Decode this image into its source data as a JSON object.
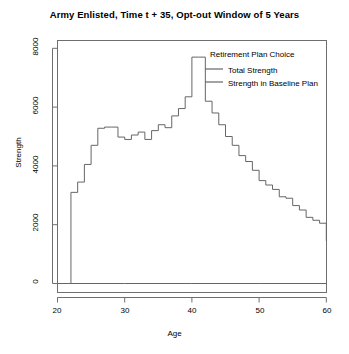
{
  "chart_data": {
    "type": "line",
    "title": "Army Enlisted, Time t + 35, Opt-out Window of 5 Years",
    "xlabel": "Age",
    "ylabel": "Strength",
    "xlim": [
      20,
      60
    ],
    "ylim": [
      0,
      8000
    ],
    "xticks": [
      20,
      30,
      40,
      50,
      60
    ],
    "yticks": [
      0,
      2000,
      4000,
      6000,
      8000
    ],
    "grid": false,
    "legend_position": "top-right-inside",
    "legend_title": "Retirement Plan Choice",
    "line_color": "#666666",
    "series": [
      {
        "name": "Total Strength",
        "style": "step",
        "x": [
          20,
          21,
          22,
          23,
          24,
          25,
          26,
          27,
          28,
          29,
          30,
          31,
          32,
          33,
          34,
          35,
          36,
          37,
          38,
          39,
          40,
          41,
          42,
          43,
          44,
          45,
          46,
          47,
          48,
          49,
          50,
          51,
          52,
          53,
          54,
          55,
          56,
          57,
          58,
          59,
          60
        ],
        "values": [
          0,
          0,
          3100,
          3450,
          4050,
          4700,
          5280,
          5320,
          5320,
          4980,
          4900,
          5050,
          5150,
          4900,
          5200,
          5400,
          5300,
          5700,
          5950,
          6350,
          7700,
          7700,
          6200,
          5800,
          5400,
          5000,
          4700,
          4350,
          4150,
          3850,
          3500,
          3350,
          3200,
          2950,
          2900,
          2650,
          2500,
          2250,
          2150,
          2050,
          1450
        ]
      },
      {
        "name": "Strength in Baseline Plan",
        "style": "step",
        "x": [
          20,
          22,
          30,
          40,
          50,
          60
        ],
        "values": [
          0,
          0,
          0,
          0,
          0,
          0
        ]
      }
    ]
  },
  "axis": {
    "ytick_labels": [
      "0",
      "2000",
      "4000",
      "6000",
      "8000"
    ],
    "xtick_labels": [
      "20",
      "30",
      "40",
      "50",
      "60"
    ]
  },
  "legend": {
    "title": "Retirement Plan Choice",
    "items": [
      {
        "label": "Total Strength"
      },
      {
        "label": "Strength in Baseline Plan"
      }
    ]
  }
}
